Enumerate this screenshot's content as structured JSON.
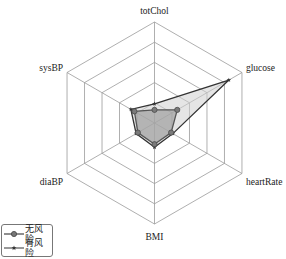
{
  "chart_data": {
    "type": "radar",
    "title": "",
    "axes": [
      "totChol",
      "glucose",
      "heartRate",
      "BMI",
      "diaBP",
      "sysBP"
    ],
    "range": [
      0,
      1
    ],
    "rings": 5,
    "grid": true,
    "legend_position": "bottom-left",
    "series": [
      {
        "name": "无风险",
        "marker": "circle",
        "line_color": "#555555",
        "fill_color": "#9a9a9a",
        "fill_opacity": 0.65,
        "values": [
          0.13,
          0.26,
          0.19,
          0.21,
          0.19,
          0.23
        ]
      },
      {
        "name": "有风险",
        "marker": "star",
        "line_color": "#333333",
        "fill_color": "#cfcfcf",
        "fill_opacity": 0.55,
        "values": [
          0.19,
          0.85,
          0.21,
          0.24,
          0.21,
          0.27
        ]
      }
    ]
  },
  "legend": {
    "items": [
      {
        "label": "无风险"
      },
      {
        "label": "有风险"
      }
    ]
  }
}
